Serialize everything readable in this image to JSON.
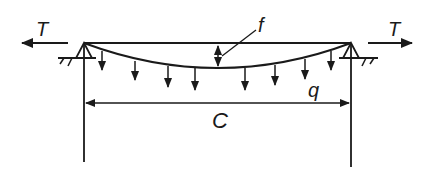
{
  "diagram": {
    "type": "cable-with-distributed-load",
    "labels": {
      "tension_left": "T",
      "tension_right": "T",
      "sag": "f",
      "load": "q",
      "span": "C"
    },
    "colors": {
      "stroke": "#1a1a1a",
      "background": "#ffffff"
    },
    "load_arrow_count": 8
  }
}
